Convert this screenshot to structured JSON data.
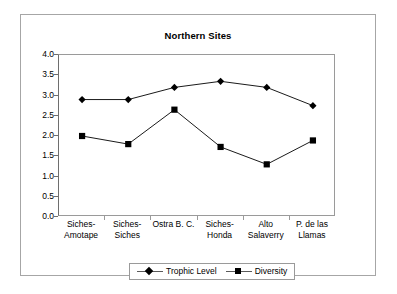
{
  "chart_data": {
    "type": "line",
    "title": "Northern Sites",
    "xlabel": "",
    "ylabel": "",
    "ylim": [
      0.0,
      4.0
    ],
    "ytick_step": 0.5,
    "yticks": [
      "4.0",
      "3.5",
      "3.0",
      "2.5",
      "2.0",
      "1.5",
      "1.0",
      "0.5",
      "0.0"
    ],
    "grid": false,
    "legend_position": "bottom",
    "categories": [
      "Siches-Amotape",
      "Siches-Siches",
      "Ostra B. C.",
      "Siches-Honda",
      "Alto Salaverry",
      "P. de las Llamas"
    ],
    "category_lines": [
      [
        "Siches-",
        "Amotape"
      ],
      [
        "Siches-",
        "Siches"
      ],
      [
        "Ostra B. C.",
        ""
      ],
      [
        "Siches-",
        "Honda"
      ],
      [
        "Alto",
        "Salaverry"
      ],
      [
        "P. de las",
        "Llamas"
      ]
    ],
    "series": [
      {
        "name": "Trophic Level",
        "marker": "diamond",
        "color": "#000000",
        "values": [
          2.9,
          2.9,
          3.2,
          3.35,
          3.2,
          2.75
        ]
      },
      {
        "name": "Diversity",
        "marker": "square",
        "color": "#000000",
        "values": [
          2.0,
          1.8,
          2.65,
          1.73,
          1.3,
          1.89
        ]
      }
    ]
  },
  "legend": {
    "entries": [
      {
        "label": "Trophic Level",
        "marker": "diamond"
      },
      {
        "label": "Diversity",
        "marker": "square"
      }
    ]
  },
  "colors": {
    "series": "#000000",
    "frame_border": "#a6a6a6",
    "plot_border": "#9a9a9a",
    "axis_line": "#6e6e6e",
    "background": "#ffffff"
  }
}
